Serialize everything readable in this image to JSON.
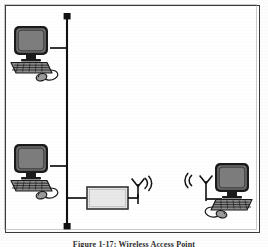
{
  "figure": {
    "caption": "Figure 1-17: Wireless Access Point",
    "frame_color": "#3b3b3b",
    "background_color": "#ffffff"
  },
  "diagram": {
    "type": "network-topology",
    "backbone": {
      "label": "network-backbone-bus",
      "orientation": "vertical",
      "color": "#111111",
      "terminator_shape": "square",
      "terminator_color": "#111111"
    },
    "nodes": [
      {
        "id": "workstation-top-left",
        "type": "desktop-computer",
        "label": "",
        "connection": "wired",
        "x": 33,
        "y": 50
      },
      {
        "id": "workstation-bottom-left",
        "type": "desktop-computer",
        "label": "",
        "connection": "wired",
        "x": 33,
        "y": 168
      },
      {
        "id": "access-point",
        "type": "access-point-box",
        "label": "",
        "connection": "wired-and-wireless",
        "fill_color": "#e6e6e6",
        "border_color": "#333333",
        "x": 105,
        "y": 198
      },
      {
        "id": "workstation-wireless-right",
        "type": "desktop-computer",
        "label": "",
        "connection": "wireless",
        "x": 228,
        "y": 190
      }
    ],
    "antennas": [
      {
        "id": "antenna-access-point",
        "wave_direction": "right",
        "color": "#111111"
      },
      {
        "id": "antenna-client",
        "wave_direction": "left",
        "color": "#111111"
      }
    ],
    "links": [
      {
        "from": "workstation-top-left",
        "to": "backbone",
        "kind": "wired"
      },
      {
        "from": "workstation-bottom-left",
        "to": "backbone",
        "kind": "wired"
      },
      {
        "from": "access-point",
        "to": "backbone",
        "kind": "wired"
      },
      {
        "from": "access-point",
        "to": "workstation-wireless-right",
        "kind": "wireless"
      }
    ]
  }
}
